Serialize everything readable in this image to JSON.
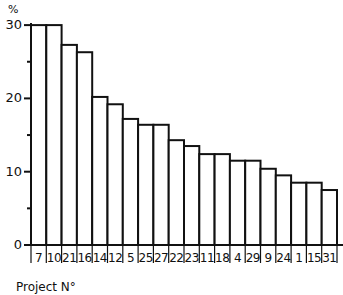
{
  "chart_data": {
    "type": "bar",
    "title": "",
    "xlabel": "Project N°",
    "ylabel": "%",
    "ylim": [
      0,
      30
    ],
    "yticks": [
      0,
      10,
      20,
      30
    ],
    "grid": false,
    "legend": null,
    "categories": [
      "7",
      "10",
      "21",
      "16",
      "14",
      "12",
      "5",
      "25",
      "27",
      "22",
      "23",
      "11",
      "18",
      "4",
      "29",
      "9",
      "24",
      "1",
      "15",
      "31"
    ],
    "values": [
      30,
      30,
      27.3,
      26.3,
      20.2,
      19.2,
      17.2,
      16.4,
      16.4,
      14.3,
      13.5,
      12.4,
      12.4,
      11.5,
      11.5,
      10.4,
      9.5,
      8.5,
      8.5,
      7.5
    ]
  },
  "labels": {
    "y_unit": "%",
    "x_title": "Project N°",
    "y_ticks": [
      "0",
      "10",
      "20",
      "30"
    ]
  },
  "colors": {
    "bar_fill": "#ffffff",
    "bar_stroke": "#111111",
    "axis": "#111111"
  }
}
